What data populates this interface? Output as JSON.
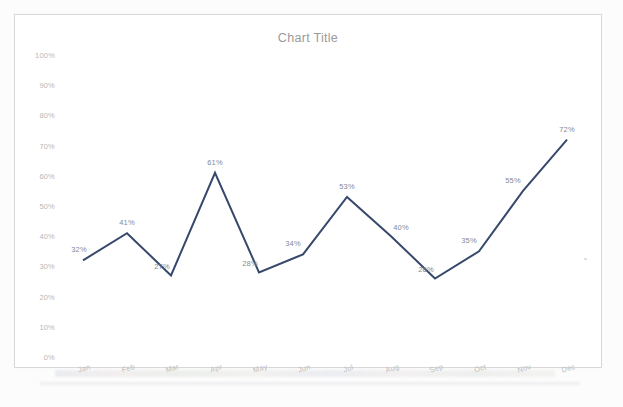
{
  "document": {
    "kind": "scanned-chart-page",
    "background_color": "#fcfcfc",
    "frame_border_color": "#d8d8d8"
  },
  "chart_data": {
    "type": "line",
    "title": "Chart Title",
    "xlabel": "",
    "ylabel": "",
    "categories": [
      "Jan",
      "Feb",
      "Mar",
      "Apr",
      "May",
      "Jun",
      "Jul",
      "Aug",
      "Sep",
      "Oct",
      "Nov",
      "Dec"
    ],
    "values": [
      32,
      41,
      27,
      61,
      28,
      34,
      53,
      40,
      26,
      35,
      55,
      72
    ],
    "data_labels": [
      "32%",
      "41%",
      "27%",
      "61%",
      "28%",
      "34%",
      "53%",
      "40%",
      "26%",
      "35%",
      "55%",
      "72%"
    ],
    "ylim": [
      0,
      100
    ],
    "ytick_values": [
      0,
      10,
      20,
      30,
      40,
      50,
      60,
      70,
      80,
      90,
      100
    ],
    "ytick_labels": [
      "0%",
      "10%",
      "20%",
      "30%",
      "40%",
      "50%",
      "60%",
      "70%",
      "80%",
      "90%",
      "100%"
    ],
    "grid": false,
    "legend": false,
    "series_color": "#36486b",
    "series_line_width": 2,
    "markers": false,
    "axis_label_color": "#b8b8b8",
    "title_color": "#9a9a9a",
    "data_label_color": "#7f8a9c",
    "xtick_rotation_deg": -16
  }
}
